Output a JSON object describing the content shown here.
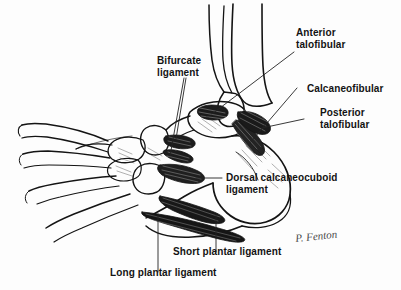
{
  "figure": {
    "background_color": "#fdfdfd",
    "ink_color": "#141414",
    "style": "pen-and-ink anatomical line drawing with cross-hatched shading"
  },
  "labels": {
    "bifurcate": "Bifurcate\nligament",
    "anterior_talofibular": "Anterior\ntalofibular",
    "calcaneofibular": "Calcaneofibular",
    "posterior_talofibular": "Posterior\ntalofibular",
    "dorsal_calcaneocuboid": "Dorsal calcaneocuboid\nligament",
    "short_plantar": "Short plantar ligament",
    "long_plantar": "Long plantar ligament"
  },
  "signature": "P. Fenton",
  "anatomy": {
    "structures": [
      "tibia",
      "fibula",
      "talus",
      "calcaneus",
      "navicular",
      "cuboid",
      "cuneiforms",
      "metatarsals",
      "phalanges"
    ],
    "ligaments": [
      "Bifurcate ligament",
      "Anterior talofibular",
      "Calcaneofibular",
      "Posterior talofibular",
      "Dorsal calcaneocuboid ligament",
      "Short plantar ligament",
      "Long plantar ligament"
    ]
  }
}
